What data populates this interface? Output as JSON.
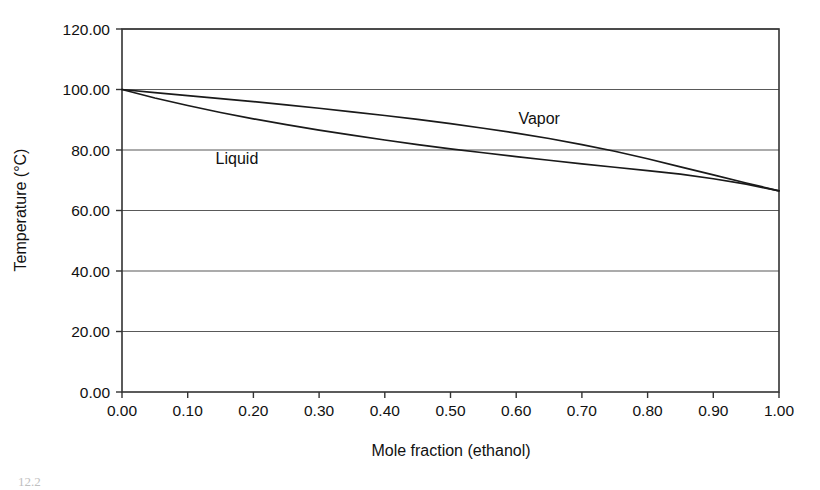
{
  "chart_data": {
    "type": "line",
    "title": "",
    "xlabel": "Mole fraction (ethanol)",
    "ylabel": "Temperature (°C)",
    "xlim": [
      0.0,
      1.0
    ],
    "ylim": [
      0.0,
      120.0
    ],
    "grid": "horizontal",
    "legend_position": "inline-annotations",
    "x_ticks": [
      "0.00",
      "0.10",
      "0.20",
      "0.30",
      "0.40",
      "0.50",
      "0.60",
      "0.70",
      "0.80",
      "0.90",
      "1.00"
    ],
    "y_ticks": [
      "0.00",
      "20.00",
      "40.00",
      "60.00",
      "80.00",
      "100.00",
      "120.00"
    ],
    "x_tick_values": [
      0.0,
      0.1,
      0.2,
      0.3,
      0.4,
      0.5,
      0.6,
      0.7,
      0.8,
      0.9,
      1.0
    ],
    "y_tick_values": [
      0,
      20,
      40,
      60,
      80,
      100,
      120
    ],
    "x": [
      0.0,
      0.05,
      0.1,
      0.15,
      0.2,
      0.25,
      0.3,
      0.35,
      0.4,
      0.45,
      0.5,
      0.55,
      0.6,
      0.65,
      0.7,
      0.75,
      0.8,
      0.85,
      0.9,
      0.95,
      1.0
    ],
    "series": [
      {
        "name": "Vapor",
        "color": "#1a1a1a",
        "values": [
          100.0,
          99.0,
          98.0,
          97.0,
          96.0,
          94.9,
          93.8,
          92.6,
          91.4,
          90.1,
          88.7,
          87.2,
          85.6,
          83.8,
          81.8,
          79.6,
          77.1,
          74.4,
          71.8,
          69.1,
          66.5
        ]
      },
      {
        "name": "Liquid",
        "color": "#1a1a1a",
        "values": [
          100.0,
          97.2,
          94.7,
          92.4,
          90.3,
          88.4,
          86.6,
          84.9,
          83.3,
          81.8,
          80.4,
          79.1,
          77.8,
          76.6,
          75.4,
          74.3,
          73.2,
          72.0,
          70.5,
          68.7,
          66.5
        ]
      }
    ],
    "annotations": [
      {
        "text": "Vapor",
        "x": 0.635,
        "y": 88.5
      },
      {
        "text": "Liquid",
        "x": 0.175,
        "y": 75.5
      }
    ]
  },
  "axes": {
    "y_title": "Temperature (°C)",
    "x_title": "Mole fraction (ethanol)"
  },
  "caption": {
    "text": "12.2"
  },
  "style": {
    "line_color": "#1a1a1a",
    "grid_color": "#595959",
    "frame_color": "#333333",
    "background": "#ffffff"
  }
}
